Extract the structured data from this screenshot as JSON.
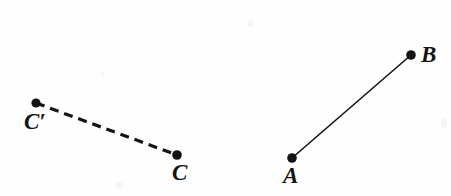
{
  "figure": {
    "type": "geometry-line-segments-diagram",
    "background_color": "#fefefe",
    "ink_color": "#141414",
    "width": 451,
    "height": 196,
    "points": [
      {
        "id": "c-prime",
        "label": "C′",
        "x": 36,
        "y": 103,
        "radius": 4.6,
        "label_x": 24,
        "label_y": 110
      },
      {
        "id": "c",
        "label": "C",
        "x": 177,
        "y": 155,
        "radius": 4.8,
        "label_x": 172,
        "label_y": 161
      },
      {
        "id": "a",
        "label": "A",
        "x": 292,
        "y": 158,
        "radius": 4.8,
        "label_x": 283,
        "label_y": 164
      },
      {
        "id": "b",
        "label": "B",
        "x": 411,
        "y": 55,
        "radius": 4.8,
        "label_x": 421,
        "label_y": 43
      }
    ],
    "segments": [
      {
        "id": "segment-c-prime-c",
        "from": "c-prime",
        "to": "c",
        "style": "dashed",
        "stroke_width": 3.2,
        "dash_length": 9,
        "gap_length": 6,
        "x1": 36,
        "y1": 103,
        "x2": 177,
        "y2": 155
      },
      {
        "id": "segment-a-b",
        "from": "a",
        "to": "b",
        "style": "solid",
        "stroke_width": 1.6,
        "x1": 292,
        "y1": 158,
        "x2": 411,
        "y2": 55
      }
    ]
  }
}
